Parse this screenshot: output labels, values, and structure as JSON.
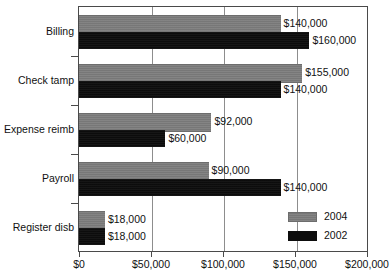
{
  "chart_data": {
    "type": "bar",
    "orientation": "horizontal",
    "title": "",
    "xlabel": "",
    "ylabel": "",
    "categories": [
      "Billing",
      "Check tamp",
      "Expense reimb",
      "Payroll",
      "Register disb"
    ],
    "series": [
      {
        "name": "2004",
        "color": "#7d7d7d",
        "values": [
          140000,
          155000,
          92000,
          90000,
          18000
        ],
        "labels": [
          "$140,000",
          "$155,000",
          "$92,000",
          "$90,000",
          "$18,000"
        ]
      },
      {
        "name": "2002",
        "color": "#0d0d0d",
        "values": [
          160000,
          140000,
          60000,
          140000,
          18000
        ],
        "labels": [
          "$160,000",
          "$140,000",
          "$60,000",
          "$140,000",
          "$18,000"
        ]
      }
    ],
    "xlim": [
      0,
      200000
    ],
    "xticks": [
      0,
      50000,
      100000,
      150000,
      200000
    ],
    "xticklabels": [
      "$0",
      "$50,000",
      "$100,000",
      "$150,000",
      "$200,000"
    ],
    "grid": true,
    "grid_axis": "x",
    "legend": {
      "position": "bottom-right",
      "entries": [
        {
          "label": "2004",
          "color": "#7d7d7d"
        },
        {
          "label": "2002",
          "color": "#0d0d0d"
        }
      ]
    }
  }
}
